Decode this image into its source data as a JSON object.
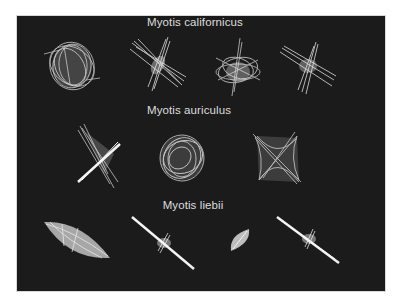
{
  "figure": {
    "background": "#ffffff",
    "panel_color": "#1b1b1b",
    "stroke_color": "#e6e6e6",
    "groups": [
      {
        "species": "Myotis californicus",
        "shapes": [
          {
            "kind": "tangled-sphere",
            "cx": 71,
            "cy": 65
          },
          {
            "kind": "cross-burst",
            "cx": 158,
            "cy": 65
          },
          {
            "kind": "star-tangle",
            "cx": 237,
            "cy": 68
          },
          {
            "kind": "cross-burst",
            "cx": 307,
            "cy": 66
          }
        ]
      },
      {
        "species": "Myotis auriculus",
        "shapes": [
          {
            "kind": "x-burst",
            "cx": 98,
            "cy": 156
          },
          {
            "kind": "tangled-sphere",
            "cx": 180,
            "cy": 158
          },
          {
            "kind": "x-tangle",
            "cx": 276,
            "cy": 155
          }
        ]
      },
      {
        "species": "Myotis liebii",
        "shapes": [
          {
            "kind": "lens",
            "cx": 76,
            "cy": 239
          },
          {
            "kind": "needle",
            "cx": 163,
            "cy": 243
          },
          {
            "kind": "small-lens",
            "cx": 240,
            "cy": 240
          },
          {
            "kind": "needle",
            "cx": 307,
            "cy": 240
          }
        ]
      }
    ]
  }
}
